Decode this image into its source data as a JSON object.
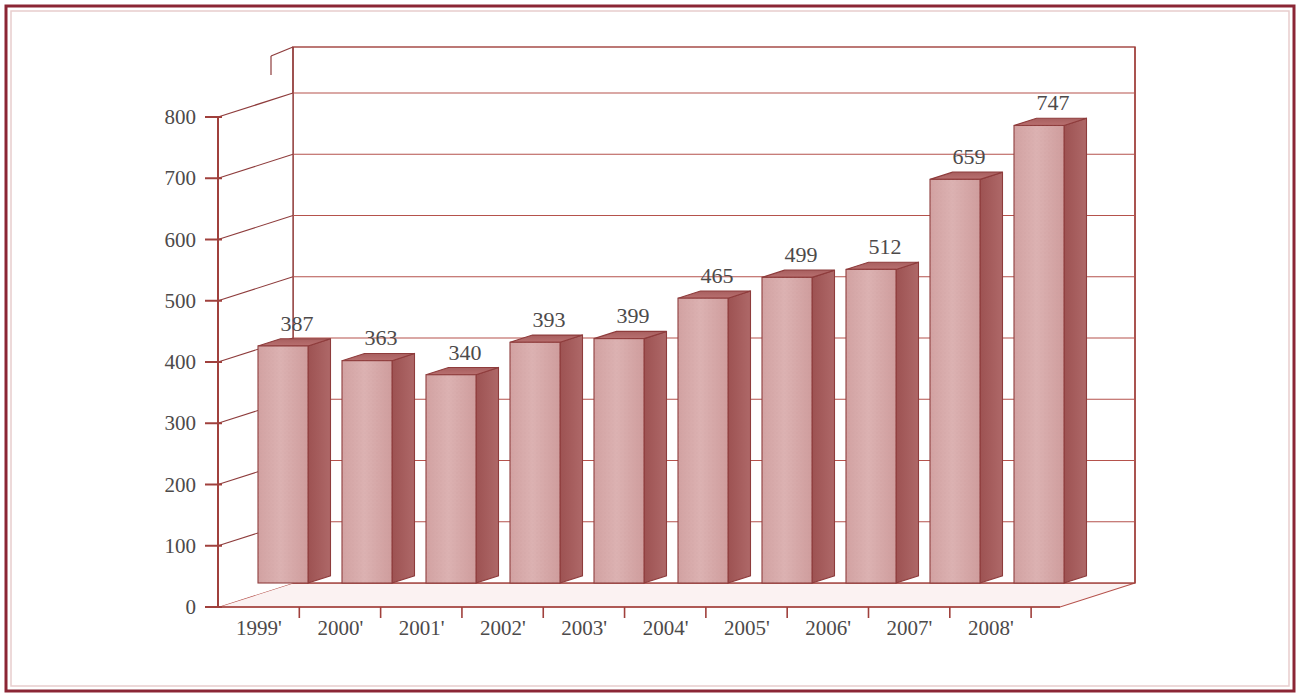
{
  "chart_data": {
    "type": "bar",
    "title": "",
    "subtitle": "",
    "xlabel": "",
    "ylabel": "",
    "categories": [
      "1999'",
      "2000'",
      "2001'",
      "2002'",
      "2003'",
      "2004'",
      "2005'",
      "2006'",
      "2007'",
      "2008'"
    ],
    "values": [
      387,
      363,
      340,
      393,
      399,
      465,
      499,
      512,
      659,
      747
    ],
    "data_labels": [
      "387",
      "363",
      "340",
      "393",
      "399",
      "465",
      "499",
      "512",
      "659",
      "747"
    ],
    "ylim": [
      0,
      800
    ],
    "ytick_step": 100,
    "ytick_labels": [
      "0",
      "100",
      "200",
      "300",
      "400",
      "500",
      "600",
      "700",
      "800"
    ],
    "ytick_values": [
      0,
      100,
      200,
      300,
      400,
      500,
      600,
      700,
      800
    ],
    "grid": true,
    "grid_orientation": "horizontal",
    "legend": false,
    "legend_position": "none",
    "style": "3d-column",
    "annotations": []
  },
  "colors": {
    "frame_border": "#8b2635",
    "axis_line": "#a0403c",
    "gridline": "#b5524c",
    "bar_front": "#d6aaaa",
    "bar_top": "#a85f5f",
    "bar_side": "#9e5353",
    "bar_edge": "#8e3c3c",
    "floor": "#fbf2f2",
    "wall": "#ffffff",
    "label_text": "#4d4a4a",
    "background": "#ffffff"
  },
  "geometry": {
    "origin_x": 218,
    "origin_y": 607,
    "plot_top_y": 117,
    "depth_dx": 75,
    "depth_dy": -24,
    "bar_width": 50,
    "bar_pitch": 84,
    "first_bar_x": 258,
    "wall_right_x": 1135,
    "wall_top_y": 47
  }
}
